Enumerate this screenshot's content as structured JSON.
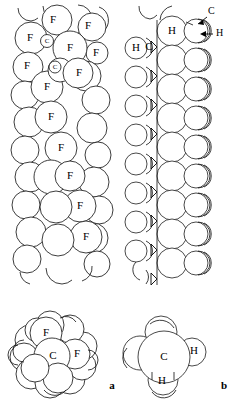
{
  "figure": {
    "background_color": "#ffffff",
    "line_color": "#1a1a1a",
    "panels": [
      {
        "id": "a",
        "letter": "a",
        "molecule": "polytetrafluoroethylene",
        "view_chain": "helical chain side view",
        "view_end": "end-on cross section",
        "atom_labels": [
          "F",
          "C"
        ]
      },
      {
        "id": "b",
        "letter": "b",
        "molecule": "polyethylene",
        "view_chain": "planar zig-zag chain side view",
        "view_end": "end-on cross section",
        "atom_labels": [
          "H",
          "C"
        ]
      }
    ],
    "labels": {
      "fluorine": "F",
      "carbon": "C",
      "hydrogen": "H",
      "panel_a": "a",
      "panel_b": "b"
    },
    "chain_a_f_labels": [
      {
        "x": 53,
        "y": 20
      },
      {
        "x": 88,
        "y": 26
      },
      {
        "x": 30,
        "y": 38
      },
      {
        "x": 70,
        "y": 48
      },
      {
        "x": 95,
        "y": 52
      },
      {
        "x": 27,
        "y": 66
      },
      {
        "x": 79,
        "y": 73
      },
      {
        "x": 47,
        "y": 87
      },
      {
        "x": 50,
        "y": 117
      },
      {
        "x": 60,
        "y": 148
      },
      {
        "x": 70,
        "y": 175
      },
      {
        "x": 80,
        "y": 206
      },
      {
        "x": 86,
        "y": 237
      }
    ],
    "chain_a_c_labels": [
      {
        "x": 47,
        "y": 41
      },
      {
        "x": 55,
        "y": 67
      }
    ],
    "chain_b_labels": [
      {
        "text": "H",
        "x": 172,
        "y": 30,
        "kind": "in-sphere"
      },
      {
        "text": "H",
        "x": 132,
        "y": 48,
        "kind": "in-sphere"
      },
      {
        "text": "C",
        "x": 146,
        "y": 47,
        "kind": "plain"
      }
    ],
    "annotations": [
      {
        "text": "C",
        "x": 212,
        "y": 13,
        "arrow_from": [
          209,
          16
        ],
        "arrow_to": [
          198,
          24
        ]
      },
      {
        "text": "H",
        "x": 213,
        "y": 34,
        "arrow_from": [
          211,
          34
        ],
        "arrow_to": [
          199,
          34
        ]
      }
    ],
    "end_view_a_labels": [
      {
        "text": "F",
        "x": 46,
        "y": 333
      },
      {
        "text": "C",
        "x": 53,
        "y": 356
      },
      {
        "text": "F",
        "x": 76,
        "y": 354
      }
    ],
    "end_view_b_labels": [
      {
        "text": "C",
        "x": 164,
        "y": 357
      },
      {
        "text": "H",
        "x": 194,
        "y": 351
      },
      {
        "text": "H",
        "x": 162,
        "y": 382
      }
    ],
    "panel_letter_positions": [
      {
        "letter": "a",
        "x": 112,
        "y": 386
      },
      {
        "letter": "b",
        "x": 224,
        "y": 386
      }
    ]
  }
}
